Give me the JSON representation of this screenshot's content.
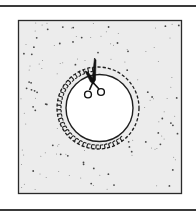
{
  "figure": {
    "icons": {
      "scissors": "scissors-icon",
      "cut_line": "dashed-cut-line",
      "seam_allowance": "hatched-seam-allowance",
      "circle": "circle-shape",
      "fabric": "stippled-fabric-square"
    },
    "colors": {
      "ink": "#1e1e1e",
      "fabric_fill": "#ececec",
      "circle_fill": "#ffffff",
      "rule": "#3a3a3a",
      "background": "#ffffff"
    },
    "geometry": {
      "frame": {
        "x": 18,
        "y": 20,
        "w": 164,
        "h": 174
      },
      "circle_center": [
        98,
        108
      ],
      "outer_dashed_radius": 41,
      "inner_dashed_radius": 37,
      "solid_circle_radius": 34,
      "top_rule_y": 5,
      "bottom_rule_y": 209
    }
  }
}
